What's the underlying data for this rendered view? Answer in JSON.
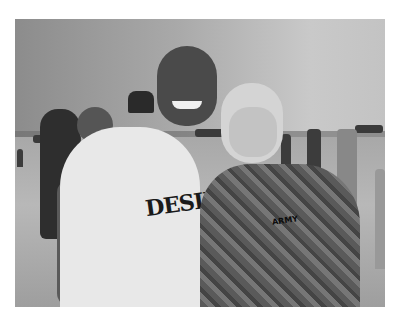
{
  "image": {
    "description": "Black-and-white photograph of two men posing together on an airfield tarmac with helicopters and bystanders in the background",
    "subjects": [
      {
        "role": "man-left",
        "clothing": "white t-shirt with print",
        "shirt_text": "DESIRE"
      },
      {
        "role": "man-right",
        "clothing": "camouflage army uniform",
        "tag_text": "ARMY"
      }
    ],
    "background": [
      "helicopters",
      "airfield tarmac",
      "bystanders",
      "overcast sky"
    ],
    "color_mode": "grayscale"
  }
}
